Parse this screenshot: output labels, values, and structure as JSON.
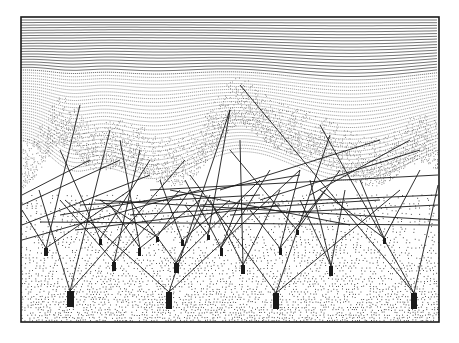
{
  "artwork": {
    "frame": {
      "x": 21,
      "y": 17,
      "width": 418,
      "height": 305
    },
    "colors": {
      "ink": "#1a1a1a",
      "paper": "#ffffff",
      "stipple": "#2a2a2a"
    },
    "blocks": [
      {
        "x": 44,
        "y": 248,
        "w": 4,
        "h": 8
      },
      {
        "x": 99,
        "y": 239,
        "w": 3,
        "h": 6
      },
      {
        "x": 112,
        "y": 262,
        "w": 4,
        "h": 9
      },
      {
        "x": 138,
        "y": 248,
        "w": 3,
        "h": 8
      },
      {
        "x": 156,
        "y": 237,
        "w": 3,
        "h": 5
      },
      {
        "x": 174,
        "y": 263,
        "w": 5,
        "h": 10
      },
      {
        "x": 181,
        "y": 240,
        "w": 3,
        "h": 6
      },
      {
        "x": 207,
        "y": 235,
        "w": 3,
        "h": 5
      },
      {
        "x": 220,
        "y": 248,
        "w": 3,
        "h": 8
      },
      {
        "x": 241,
        "y": 265,
        "w": 4,
        "h": 9
      },
      {
        "x": 279,
        "y": 248,
        "w": 3,
        "h": 7
      },
      {
        "x": 296,
        "y": 230,
        "w": 3,
        "h": 5
      },
      {
        "x": 329,
        "y": 266,
        "w": 4,
        "h": 10
      },
      {
        "x": 383,
        "y": 238,
        "w": 3,
        "h": 6
      },
      {
        "x": 67,
        "y": 291,
        "w": 7,
        "h": 16
      },
      {
        "x": 166,
        "y": 292,
        "w": 6,
        "h": 17
      },
      {
        "x": 273,
        "y": 293,
        "w": 6,
        "h": 16
      },
      {
        "x": 411,
        "y": 293,
        "w": 6,
        "h": 16
      }
    ],
    "lines": [
      [
        70,
        291,
        39,
        190
      ],
      [
        70,
        291,
        110,
        130
      ],
      [
        70,
        291,
        185,
        160
      ],
      [
        169,
        292,
        65,
        200
      ],
      [
        169,
        292,
        230,
        110
      ],
      [
        169,
        292,
        300,
        170
      ],
      [
        276,
        293,
        190,
        175
      ],
      [
        276,
        293,
        330,
        135
      ],
      [
        276,
        293,
        400,
        190
      ],
      [
        414,
        293,
        320,
        125
      ],
      [
        414,
        293,
        438,
        185
      ],
      [
        414,
        293,
        240,
        85
      ],
      [
        46,
        248,
        22,
        210
      ],
      [
        46,
        248,
        80,
        105
      ],
      [
        46,
        248,
        130,
        190
      ],
      [
        100,
        239,
        150,
        160
      ],
      [
        100,
        239,
        60,
        150
      ],
      [
        114,
        262,
        60,
        200
      ],
      [
        114,
        262,
        180,
        190
      ],
      [
        114,
        262,
        140,
        150
      ],
      [
        140,
        248,
        110,
        205
      ],
      [
        140,
        248,
        200,
        200
      ],
      [
        140,
        248,
        120,
        140
      ],
      [
        157,
        237,
        190,
        190
      ],
      [
        157,
        237,
        100,
        200
      ],
      [
        176,
        263,
        210,
        195
      ],
      [
        176,
        263,
        130,
        200
      ],
      [
        176,
        263,
        260,
        180
      ],
      [
        182,
        240,
        160,
        180
      ],
      [
        182,
        240,
        230,
        200
      ],
      [
        208,
        235,
        230,
        110
      ],
      [
        208,
        235,
        185,
        205
      ],
      [
        221,
        248,
        240,
        200
      ],
      [
        221,
        248,
        270,
        170
      ],
      [
        221,
        248,
        185,
        180
      ],
      [
        243,
        265,
        210,
        200
      ],
      [
        243,
        265,
        280,
        190
      ],
      [
        243,
        265,
        240,
        140
      ],
      [
        280,
        248,
        250,
        210
      ],
      [
        280,
        248,
        325,
        190
      ],
      [
        280,
        248,
        300,
        170
      ],
      [
        297,
        230,
        340,
        170
      ],
      [
        297,
        230,
        230,
        150
      ],
      [
        331,
        266,
        300,
        200
      ],
      [
        331,
        266,
        345,
        190
      ],
      [
        331,
        266,
        310,
        180
      ],
      [
        384,
        238,
        360,
        180
      ],
      [
        384,
        238,
        420,
        170
      ],
      [
        384,
        238,
        320,
        190
      ],
      [
        22,
        225,
        150,
        175
      ],
      [
        22,
        240,
        200,
        190
      ],
      [
        22,
        205,
        120,
        160
      ],
      [
        60,
        215,
        300,
        175
      ],
      [
        80,
        205,
        260,
        195
      ],
      [
        95,
        200,
        438,
        220
      ],
      [
        150,
        190,
        438,
        175
      ],
      [
        40,
        222,
        438,
        225
      ],
      [
        130,
        215,
        380,
        200
      ],
      [
        200,
        205,
        438,
        195
      ],
      [
        220,
        190,
        380,
        140
      ],
      [
        260,
        200,
        420,
        150
      ],
      [
        22,
        195,
        90,
        160
      ],
      [
        310,
        195,
        410,
        140
      ],
      [
        170,
        190,
        350,
        225
      ],
      [
        230,
        215,
        438,
        205
      ],
      [
        75,
        230,
        280,
        205
      ]
    ],
    "streamline_count": 46,
    "stipple_seed": 7
  }
}
